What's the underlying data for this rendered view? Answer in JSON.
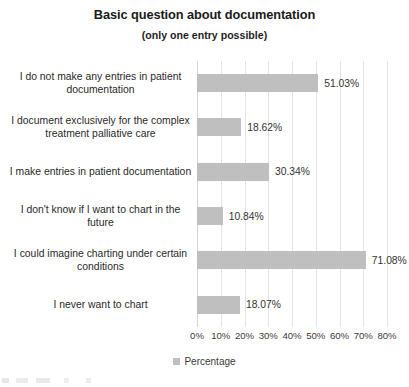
{
  "chart_data": {
    "type": "bar",
    "orientation": "horizontal",
    "title": "Basic question about documentation",
    "subtitle": "(only one entry possible)",
    "xlabel": "",
    "ylabel": "",
    "xlim": [
      0,
      80
    ],
    "grid": true,
    "legend_position": "bottom",
    "value_suffix": "%",
    "series_name": "Percentage",
    "bar_color": "#bfbfbf",
    "gridline_color": "#e4e4e4",
    "categories": [
      "I do not make any entries in patient documentation",
      "I document exclusively for the complex treatment palliative care",
      "I make entries in patient documentation",
      "I don't know if I want to chart in the future",
      "I could imagine charting under certain conditions",
      "I never want to chart"
    ],
    "values": [
      51.03,
      18.62,
      30.34,
      10.84,
      71.08,
      18.07
    ],
    "data_labels": [
      "51.03%",
      "18.62%",
      "30.34%",
      "10.84%",
      "71.08%",
      "18.07%"
    ],
    "xticks": [
      0,
      10,
      20,
      30,
      40,
      50,
      60,
      70,
      80
    ],
    "xtick_labels": [
      "0%",
      "10%",
      "20%",
      "30%",
      "40%",
      "50%",
      "60%",
      "70%",
      "80%"
    ],
    "series": [
      {
        "name": "Percentage",
        "values": [
          51.03,
          18.62,
          30.34,
          10.84,
          71.08,
          18.07
        ]
      }
    ]
  },
  "legend": {
    "entries": [
      {
        "label": "Percentage",
        "color": "#bfbfbf"
      }
    ]
  }
}
